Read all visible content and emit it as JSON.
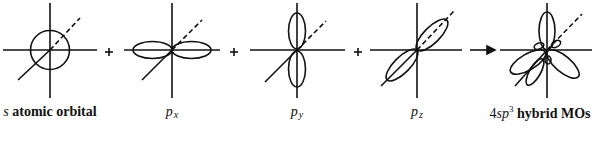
{
  "diagram": {
    "type": "sp3 hybridization",
    "operators": [
      "+",
      "+",
      "+",
      "→"
    ],
    "orbitals": [
      {
        "id": "s",
        "label_prefix": "s",
        "label_rest": " atomic orbital"
      },
      {
        "id": "px",
        "label_main": "p",
        "label_sub": "x"
      },
      {
        "id": "py",
        "label_main": "p",
        "label_sub": "y"
      },
      {
        "id": "pz",
        "label_main": "p",
        "label_sub": "z"
      },
      {
        "id": "sp3",
        "label_prefix": "4",
        "label_italic": "sp",
        "label_sup": "3",
        "label_rest": " hybrid MOs"
      }
    ]
  }
}
